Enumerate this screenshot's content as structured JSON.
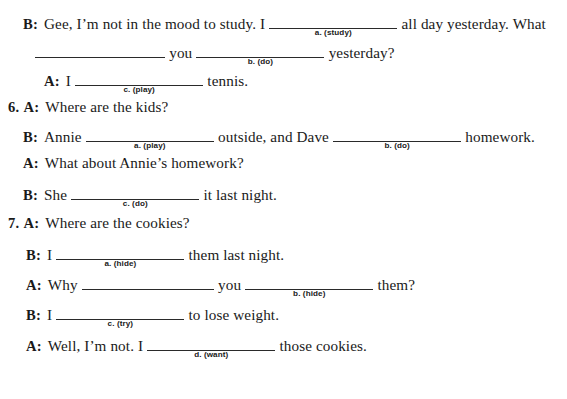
{
  "document": {
    "type": "grammar-workbook-exercise",
    "items": [
      {
        "number": "",
        "lines": [
          {
            "id": "line-5b",
            "indent": 23,
            "top": 14,
            "speaker": "B:",
            "segments": [
              {
                "kind": "text",
                "text": "Gee, I’m not in the mood to study. I"
              },
              {
                "kind": "blank",
                "width": 128,
                "hint": "a. (study)"
              },
              {
                "kind": "text",
                "text": "all day yesterday. What"
              }
            ]
          },
          {
            "id": "line-5b-cont",
            "indent": 35,
            "top": 43,
            "speaker": "",
            "segments": [
              {
                "kind": "blank",
                "width": 130,
                "hint": ""
              },
              {
                "kind": "text",
                "text": "you"
              },
              {
                "kind": "blank",
                "width": 128,
                "hint": "b. (do)"
              },
              {
                "kind": "text",
                "text": "yesterday?"
              }
            ]
          },
          {
            "id": "line-5a",
            "indent": 44,
            "top": 71,
            "speaker": "A:",
            "segments": [
              {
                "kind": "text",
                "text": "I"
              },
              {
                "kind": "blank",
                "width": 128,
                "hint": "c. (play)"
              },
              {
                "kind": "text",
                "text": "tennis."
              }
            ]
          }
        ]
      },
      {
        "number": "6.",
        "lines": [
          {
            "id": "line-6a1",
            "indent": 8,
            "top": 99,
            "number": "6.",
            "speaker": "A:",
            "segments": [
              {
                "kind": "text",
                "text": "Where are the kids?"
              }
            ]
          },
          {
            "id": "line-6b1",
            "indent": 23,
            "top": 127,
            "speaker": "B:",
            "segments": [
              {
                "kind": "text",
                "text": "Annie"
              },
              {
                "kind": "blank",
                "width": 128,
                "hint": "a. (play)"
              },
              {
                "kind": "text",
                "text": "outside, and Dave"
              },
              {
                "kind": "blank",
                "width": 128,
                "hint": "b. (do)"
              },
              {
                "kind": "text",
                "text": "homework."
              }
            ]
          },
          {
            "id": "line-6a2",
            "indent": 23,
            "top": 155,
            "speaker": "A:",
            "segments": [
              {
                "kind": "text",
                "text": "What about Annie’s homework?"
              }
            ]
          },
          {
            "id": "line-6b2",
            "indent": 23,
            "top": 185,
            "speaker": "B:",
            "segments": [
              {
                "kind": "text",
                "text": "She"
              },
              {
                "kind": "blank",
                "width": 128,
                "hint": "c. (do)"
              },
              {
                "kind": "text",
                "text": "it last night."
              }
            ]
          }
        ]
      },
      {
        "number": "7.",
        "lines": [
          {
            "id": "line-7a1",
            "indent": 8,
            "top": 215,
            "number": "7.",
            "speaker": "A:",
            "segments": [
              {
                "kind": "text",
                "text": "Where are the cookies?"
              }
            ]
          },
          {
            "id": "line-7b1",
            "indent": 26,
            "top": 245,
            "speaker": "B:",
            "segments": [
              {
                "kind": "text",
                "text": "I"
              },
              {
                "kind": "blank",
                "width": 128,
                "hint": "a. (hide)"
              },
              {
                "kind": "text",
                "text": "them last night."
              }
            ]
          },
          {
            "id": "line-7a2",
            "indent": 26,
            "top": 275,
            "speaker": "A:",
            "segments": [
              {
                "kind": "text",
                "text": "Why"
              },
              {
                "kind": "blank",
                "width": 132,
                "hint": ""
              },
              {
                "kind": "text",
                "text": "you"
              },
              {
                "kind": "blank",
                "width": 128,
                "hint": "b. (hide)"
              },
              {
                "kind": "text",
                "text": "them?"
              }
            ]
          },
          {
            "id": "line-7b2",
            "indent": 26,
            "top": 305,
            "speaker": "B:",
            "segments": [
              {
                "kind": "text",
                "text": "I"
              },
              {
                "kind": "blank",
                "width": 128,
                "hint": "c. (try)"
              },
              {
                "kind": "text",
                "text": "to lose weight."
              }
            ]
          },
          {
            "id": "line-7a3",
            "indent": 26,
            "top": 336,
            "speaker": "A:",
            "segments": [
              {
                "kind": "text",
                "text": "Well, I’m not. I"
              },
              {
                "kind": "blank",
                "width": 128,
                "hint": "d. (want)"
              },
              {
                "kind": "text",
                "text": "those cookies."
              }
            ]
          }
        ]
      }
    ]
  },
  "style": {
    "background": "#ffffff",
    "text_color": "#1a1a1a",
    "rule_color": "#2a2a2a"
  }
}
